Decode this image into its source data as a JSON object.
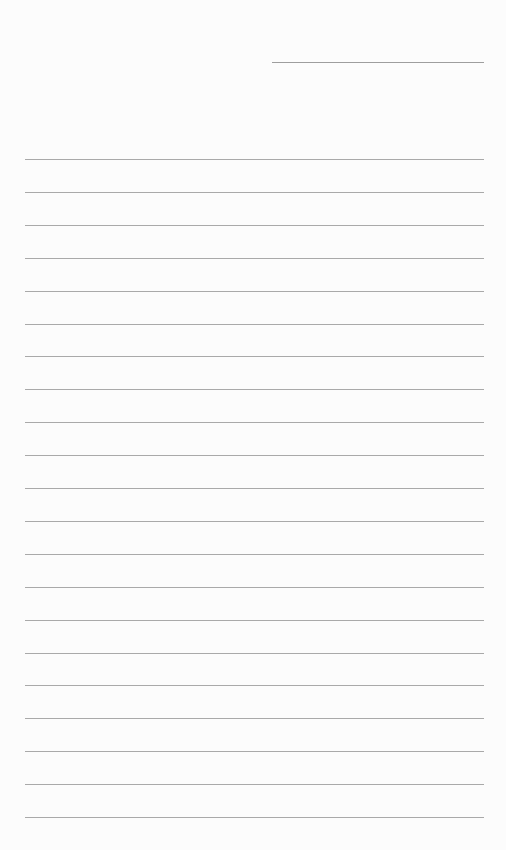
{
  "document": {
    "type": "lined-paper",
    "header_line": {
      "x": 272,
      "y": 62,
      "width": 212
    },
    "lines": {
      "count": 21,
      "start_y": 159,
      "spacing": 32.9,
      "left": 25,
      "right": 484,
      "color": "#a9a9a9"
    },
    "background_color": "#fcfcfc",
    "text": []
  }
}
